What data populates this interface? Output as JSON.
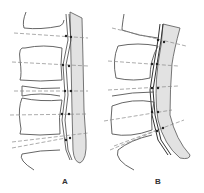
{
  "figure": {
    "panels": [
      {
        "id": "A",
        "label": "A",
        "description": "normal-alignment"
      },
      {
        "id": "B",
        "label": "B",
        "description": "curved-alignment"
      }
    ],
    "colors": {
      "outline": "#555555",
      "canal_fill": "#e2e2e2",
      "dashed_line": "#888888",
      "ligament": "#444444",
      "background": "#ffffff"
    }
  }
}
